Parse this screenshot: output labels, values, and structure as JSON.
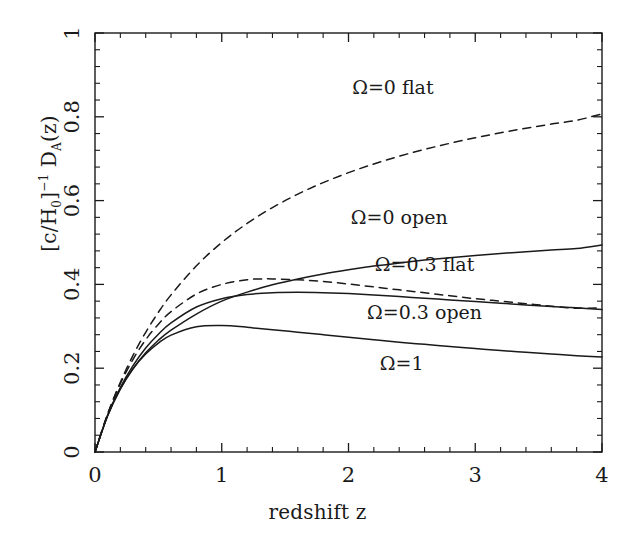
{
  "chart_data": {
    "type": "line",
    "title": "",
    "xlabel": "redshift z",
    "ylabel": "[c/H_0]^-1 D_A(z)",
    "ylabel_parts": {
      "prefix": "[c/H",
      "sub0": "0",
      "bracket": "]",
      "exp": "−1",
      "mid": " D",
      "subA": "A",
      "suffix": "(z)"
    },
    "xlim": [
      0,
      4
    ],
    "ylim": [
      0,
      1
    ],
    "xticks": [
      0,
      1,
      2,
      3,
      4
    ],
    "xticklabels": [
      "0",
      "1",
      "2",
      "3",
      "4"
    ],
    "yticks": [
      0,
      0.2,
      0.4,
      0.6,
      0.8,
      1
    ],
    "yticklabels": [
      "0",
      "0.2",
      "0.4",
      "0.6",
      "0.8",
      "1"
    ],
    "x_minor_per_major": 4,
    "y_minor_per_major": 4,
    "grid": false,
    "legend_position": "inline-annotations",
    "line_color": "#1a1a1a",
    "background": "#ffffff",
    "series": [
      {
        "name": "Ω=0 flat",
        "style": "dashed",
        "label_x": 2.35,
        "label_y": 0.855,
        "x": [
          0,
          0.1,
          0.2,
          0.3,
          0.4,
          0.5,
          0.6,
          0.8,
          1.0,
          1.2,
          1.4,
          1.6,
          1.8,
          2.0,
          2.2,
          2.4,
          2.6,
          2.8,
          3.0,
          3.2,
          3.4,
          3.6,
          3.8,
          4.0
        ],
        "y": [
          0,
          0.0905,
          0.1665,
          0.2307,
          0.2857,
          0.3333,
          0.375,
          0.4444,
          0.5,
          0.5455,
          0.5833,
          0.6154,
          0.6429,
          0.6667,
          0.6875,
          0.7059,
          0.7222,
          0.7368,
          0.75,
          0.7619,
          0.7727,
          0.7826,
          0.7917,
          0.807
        ]
      },
      {
        "name": "Ω=0 open",
        "style": "solid",
        "label_x": 2.4,
        "label_y": 0.545,
        "x": [
          0,
          0.1,
          0.2,
          0.3,
          0.4,
          0.5,
          0.6,
          0.8,
          1.0,
          1.2,
          1.4,
          1.6,
          1.8,
          2.0,
          2.2,
          2.4,
          2.6,
          2.8,
          3.0,
          3.2,
          3.4,
          3.6,
          3.8,
          4.0
        ],
        "y": [
          0,
          0.0864,
          0.15,
          0.1987,
          0.2367,
          0.2667,
          0.2906,
          0.3292,
          0.36,
          0.3815,
          0.399,
          0.413,
          0.425,
          0.435,
          0.4438,
          0.4512,
          0.458,
          0.4638,
          0.469,
          0.4738,
          0.478,
          0.482,
          0.4855,
          0.494
        ]
      },
      {
        "name": "Ω=0.3 flat",
        "style": "dashed",
        "label_x": 2.6,
        "label_y": 0.432,
        "x": [
          0,
          0.1,
          0.2,
          0.3,
          0.4,
          0.5,
          0.6,
          0.8,
          1.0,
          1.2,
          1.3,
          1.4,
          1.6,
          1.8,
          2.0,
          2.2,
          2.4,
          2.6,
          2.8,
          3.0,
          3.2,
          3.4,
          3.6,
          3.8,
          4.0
        ],
        "y": [
          0,
          0.091,
          0.163,
          0.221,
          0.268,
          0.305,
          0.335,
          0.377,
          0.4,
          0.411,
          0.413,
          0.413,
          0.411,
          0.407,
          0.401,
          0.394,
          0.387,
          0.38,
          0.373,
          0.366,
          0.36,
          0.354,
          0.348,
          0.343,
          0.344
        ]
      },
      {
        "name": "Ω=0.3 open",
        "style": "solid",
        "label_x": 2.6,
        "label_y": 0.317,
        "x": [
          0,
          0.1,
          0.2,
          0.3,
          0.4,
          0.5,
          0.6,
          0.8,
          1.0,
          1.2,
          1.4,
          1.6,
          1.8,
          2.0,
          2.2,
          2.4,
          2.6,
          2.8,
          3.0,
          3.2,
          3.4,
          3.6,
          3.8,
          4.0
        ],
        "y": [
          0,
          0.087,
          0.154,
          0.206,
          0.248,
          0.281,
          0.308,
          0.346,
          0.366,
          0.376,
          0.38,
          0.381,
          0.38,
          0.378,
          0.375,
          0.371,
          0.367,
          0.363,
          0.359,
          0.355,
          0.351,
          0.347,
          0.344,
          0.34
        ]
      },
      {
        "name": "Ω=1",
        "style": "solid",
        "label_x": 2.42,
        "label_y": 0.196,
        "x": [
          0,
          0.1,
          0.2,
          0.3,
          0.4,
          0.5,
          0.6,
          0.8,
          1.0,
          1.2,
          1.25,
          1.4,
          1.6,
          1.8,
          2.0,
          2.2,
          2.4,
          2.6,
          2.8,
          3.0,
          3.2,
          3.4,
          3.6,
          3.8,
          4.0
        ],
        "y": [
          0,
          0.0884,
          0.152,
          0.199,
          0.234,
          0.26,
          0.279,
          0.299,
          0.302,
          0.298,
          0.296,
          0.292,
          0.286,
          0.28,
          0.274,
          0.268,
          0.262,
          0.257,
          0.252,
          0.247,
          0.242,
          0.238,
          0.234,
          0.23,
          0.227
        ]
      }
    ]
  }
}
